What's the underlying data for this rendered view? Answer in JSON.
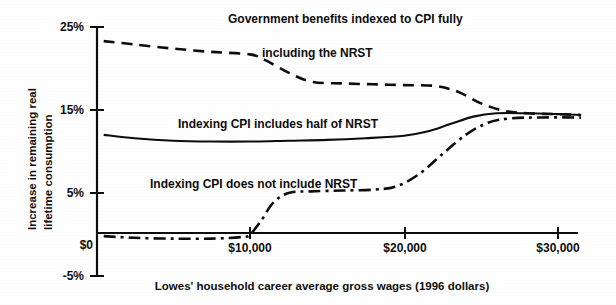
{
  "chart_data": {
    "type": "line",
    "title": "",
    "xlabel": "Lowes' household career average gross wages (1996 dollars)",
    "ylabel_line1": "Increase in remaining real",
    "ylabel_line2": "lifetime consumption",
    "xlim": [
      0,
      32000
    ],
    "ylim": [
      -5,
      25
    ],
    "grid": false,
    "legend_position": "inline-annotations",
    "x_ticks": [
      0,
      10000,
      20000,
      30000
    ],
    "x_tick_labels": [
      "$0",
      "$10,000",
      "$20,000",
      "$30,000"
    ],
    "y_ticks": [
      -5,
      5,
      15,
      25
    ],
    "y_tick_labels": [
      "-5%",
      "5%",
      "15%",
      "25%"
    ],
    "zero_line_label": "$0",
    "series": [
      {
        "name": "Government benefits indexed to CPI fully including the NRST",
        "style": "dashed",
        "annotation_line1": "Government benefits indexed  to CPI fully",
        "annotation_line2": "including the NRST",
        "x": [
          500,
          2500,
          5000,
          7500,
          10000,
          11000,
          12500,
          14000,
          16000,
          18000,
          20000,
          22000,
          23500,
          25000,
          26500,
          28000,
          30000,
          31500
        ],
        "values": [
          23.3,
          22.9,
          22.4,
          22.0,
          21.7,
          21.0,
          19.5,
          18.4,
          18.2,
          18.1,
          18.0,
          17.9,
          17.2,
          15.8,
          14.9,
          14.6,
          14.5,
          14.4
        ]
      },
      {
        "name": "Indexing CPI includes half of NRST",
        "style": "solid",
        "annotation_line1": "Indexing CPI includes half of NRST",
        "annotation_line2": "",
        "x": [
          500,
          2500,
          5000,
          7500,
          10000,
          12500,
          15000,
          17500,
          20000,
          21500,
          23000,
          24500,
          26000,
          28000,
          30000,
          31500
        ],
        "values": [
          12.0,
          11.6,
          11.3,
          11.2,
          11.2,
          11.3,
          11.4,
          11.6,
          11.9,
          12.4,
          13.3,
          14.2,
          14.6,
          14.6,
          14.5,
          14.4
        ]
      },
      {
        "name": "Indexing CPI does not include NRST",
        "style": "dashdot",
        "annotation_line1": "Indexing CPI does not include NRST",
        "annotation_line2": "",
        "x": [
          500,
          2500,
          5000,
          7500,
          9500,
          10000,
          10700,
          11500,
          12500,
          14000,
          16000,
          18000,
          19500,
          21000,
          22500,
          24000,
          25500,
          27000,
          29000,
          31500
        ],
        "values": [
          -0.2,
          -0.4,
          -0.5,
          -0.5,
          -0.3,
          0.0,
          1.6,
          3.8,
          5.0,
          5.2,
          5.3,
          5.4,
          5.8,
          7.3,
          9.7,
          12.0,
          13.5,
          14.0,
          14.1,
          14.1
        ]
      }
    ]
  },
  "colors": {
    "ink": "#0d0d0d",
    "background": "#ffffff"
  }
}
